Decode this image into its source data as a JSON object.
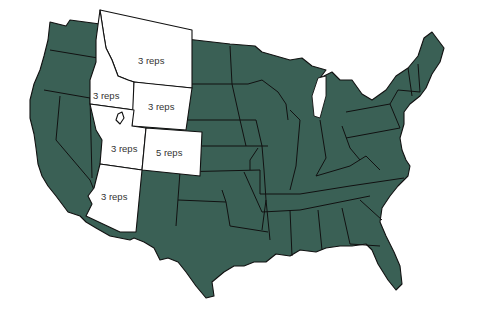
{
  "map": {
    "title": "",
    "region": "Contiguous United States",
    "colors": {
      "default_state": "#3a6055",
      "highlighted_state": "#ffffff",
      "border": "#111111",
      "label": "#333333"
    },
    "highlighted_states": [
      {
        "state": "Montana",
        "label": "3 reps"
      },
      {
        "state": "Idaho",
        "label": "3 reps"
      },
      {
        "state": "Wyoming",
        "label": "3 reps"
      },
      {
        "state": "Utah",
        "label": "3 reps"
      },
      {
        "state": "Colorado",
        "label": "5 reps"
      },
      {
        "state": "Arizona",
        "label": "3 reps"
      }
    ]
  }
}
